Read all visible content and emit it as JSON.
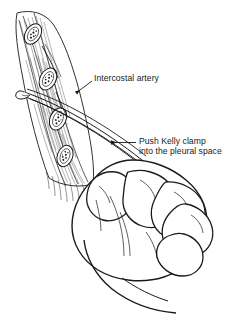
{
  "figure": {
    "style": "black-and-white pen-and-ink line drawing",
    "background_color": "#ffffff",
    "ink_color": "#1a1a1a",
    "width": 243,
    "height": 314
  },
  "annotations": [
    {
      "id": "intercostal-artery",
      "text": "Intercostal artery",
      "lines": [
        "Intercostal artery"
      ],
      "leader": {
        "type": "line-with-arrowhead",
        "points": "88,84 75,94",
        "arrow_at": "75,94",
        "arrow_direction": "down-left",
        "target": "intercostal artery running under the rib"
      },
      "text_x": 94,
      "text_y": 72.5,
      "align": "left"
    },
    {
      "id": "push-kelly-clamp",
      "text": "Push Kelly clamp into the pleural space",
      "lines": [
        "Push Kelly clamp",
        "into the pleural space"
      ],
      "leader": {
        "type": "arrow",
        "points": "136,142 110,142",
        "arrow_at": "110,142",
        "arrow_direction": "left",
        "target": "Kelly clamp shaft entering the chest wall"
      },
      "text_x": 139,
      "text_y": 136,
      "align": "left"
    }
  ],
  "anatomy": {
    "chest_wall": {
      "name": "chest wall in cross-section",
      "orientation": "diagonal band from upper-left to lower-middle",
      "rendering": "stippled and hatched soft tissue"
    },
    "ribs": {
      "name": "rib cross-sections",
      "count": 4,
      "rendering": "ovals with dark stippled marrow centers and outlined cortex",
      "centers": [
        {
          "cx": 33,
          "cy": 34,
          "rx": 11,
          "ry": 7.5,
          "rot": -58
        },
        {
          "cx": 48,
          "cy": 79,
          "rx": 11.5,
          "ry": 8,
          "rot": -62
        },
        {
          "cx": 58,
          "cy": 119,
          "rx": 11.5,
          "ry": 8,
          "rot": -66
        },
        {
          "cx": 65,
          "cy": 156,
          "rx": 11,
          "ry": 7.5,
          "rot": -70
        }
      ]
    },
    "intercostal_artery": {
      "name": "intercostal artery",
      "location": "in the costal groove along the inferior rib margin"
    },
    "pleural_space": {
      "name": "pleural space",
      "location": "deep to the chest wall, entered by the clamp tip"
    }
  },
  "instrument": {
    "name": "Kelly clamp",
    "type": "curved hemostatic forceps",
    "rendering": "long slender parallel-line shaft with curved tip",
    "direction": "angled from lower-right hand up to upper-left chest wall",
    "tip_location": "passing over the top of the rib into the pleural space"
  },
  "hand": {
    "name": "clinician hand",
    "grip": "overhand grip on the clamp shaft",
    "parts": [
      "thumb",
      "index finger",
      "middle finger",
      "ring finger",
      "little finger",
      "wrist"
    ],
    "rendering": "contour line drawing with sparse crease lines"
  }
}
